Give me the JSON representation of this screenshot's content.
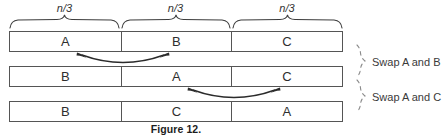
{
  "figure": {
    "caption": "Figure 12.",
    "segment_labels": [
      {
        "numerator": "n",
        "slash": "/",
        "denominator": "3",
        "text": "n/3"
      },
      {
        "numerator": "n",
        "slash": "/",
        "denominator": "3",
        "text": "n/3"
      },
      {
        "numerator": "n",
        "slash": "/",
        "denominator": "3",
        "text": "n/3"
      }
    ],
    "rows": [
      {
        "cells": [
          "A",
          "B",
          "C"
        ]
      },
      {
        "cells": [
          "B",
          "A",
          "C"
        ]
      },
      {
        "cells": [
          "B",
          "C",
          "A"
        ]
      }
    ],
    "annotations": [
      {
        "label": "Swap A and B"
      },
      {
        "label": "Swap A and C"
      }
    ],
    "swap_arcs": [
      {
        "name": "swap-arc-a-b",
        "between_rows": "1-2"
      },
      {
        "name": "swap-arc-a-c",
        "between_rows": "2-3"
      }
    ],
    "colors": {
      "background": "#ffffff",
      "bar_border": "#555555",
      "text": "#2e2e2e",
      "caption": "#1d1d1d",
      "brace": "#3c3c3c",
      "arc": "#2b2b2b",
      "side_brace": "#8a8a8a"
    }
  }
}
